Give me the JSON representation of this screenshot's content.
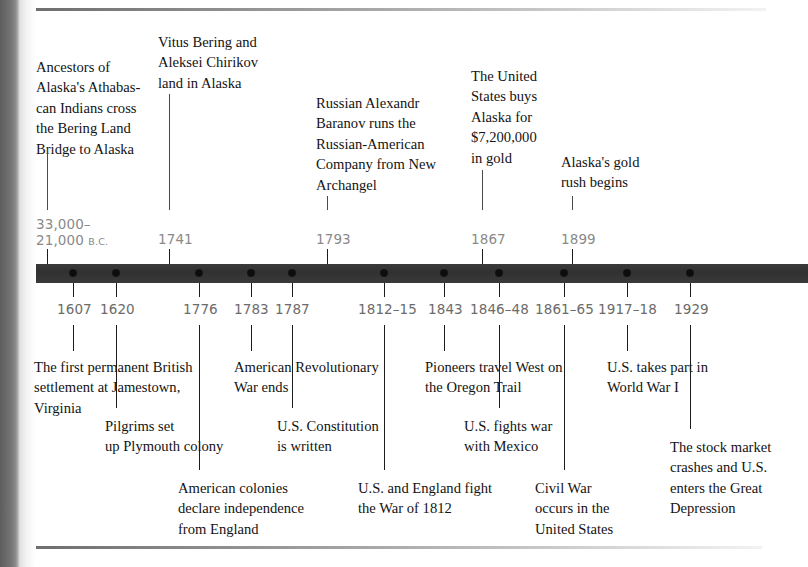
{
  "page": {
    "bar_color": "#333333",
    "year_color": "#6b6b6b",
    "text_color": "#131313"
  },
  "events_above": [
    {
      "year": "33,000–",
      "year_line2": "21,000 ",
      "year_suffix": "B.C.",
      "text": "Ancestors of\nAlaska's Athabas-\ncan Indians cross\nthe Bering Land\nBridge to Alaska"
    },
    {
      "year": "1741",
      "text": "Vitus Bering and\nAleksei Chirikov\nland in Alaska"
    },
    {
      "year": "1793",
      "text": "Russian Alexandr\nBaranov runs the\nRussian-American\nCompany from New\nArchangel"
    },
    {
      "year": "1867",
      "text": "The United\nStates buys\nAlaska for\n$7,200,000\nin gold"
    },
    {
      "year": "1899",
      "text": "Alaska's gold\nrush begins"
    }
  ],
  "events_below": [
    {
      "year": "1607",
      "text": "The first permanent British\nsettlement at Jamestown,\nVirginia"
    },
    {
      "year": "1620",
      "text": "Pilgrims set\nup Plymouth colony"
    },
    {
      "year": "1776",
      "text": "American colonies\ndeclare independence\nfrom England"
    },
    {
      "year": "1783",
      "text": "American Revolutionary\nWar ends"
    },
    {
      "year": "1787",
      "text": "U.S. Constitution\nis written"
    },
    {
      "year": "1812–15",
      "text": "U.S. and England fight\nthe War of 1812"
    },
    {
      "year": "1843",
      "text": "Pioneers travel West on\nthe Oregon Trail"
    },
    {
      "year": "1846–48",
      "text": "U.S. fights war\nwith Mexico"
    },
    {
      "year": "1861–65",
      "text": "Civil War\noccurs in the\nUnited States"
    },
    {
      "year": "1917–18",
      "text": "U.S. takes part in\nWorld War I"
    },
    {
      "year": "1929",
      "text": "The stock market\ncrashes and U.S.\nenters the Great\nDepression"
    }
  ]
}
